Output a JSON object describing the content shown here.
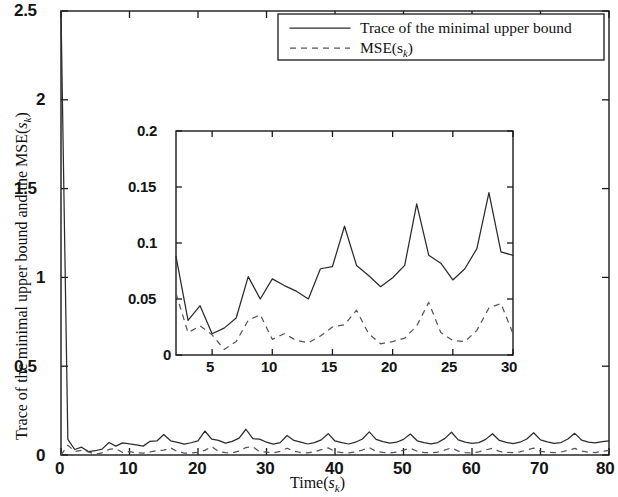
{
  "chart_data": {
    "type": "line",
    "title": "",
    "xlabel": "Time(s_k)",
    "xlabel_main": "Time",
    "xlabel_sub": "k",
    "ylabel": "Trace of the minimal upper bound and the MSE(s_k)",
    "ylabel_main": "Trace of the minimal upper bound and the MSE(",
    "ylabel_sub": "k",
    "ylabel_tail": ")",
    "xlim": [
      0,
      80
    ],
    "ylim": [
      0,
      2.5
    ],
    "grid": false,
    "legend_position": "top-right",
    "xticks": [
      0,
      10,
      20,
      30,
      40,
      50,
      60,
      70,
      80
    ],
    "xtick_labels": [
      "0",
      "10",
      "20",
      "30",
      "40",
      "50",
      "60",
      "70",
      "80"
    ],
    "yticks": [
      0,
      0.5,
      1,
      1.5,
      2,
      2.5
    ],
    "ytick_labels": [
      "0",
      "0.5",
      "1",
      "1.5",
      "2",
      "2.5"
    ],
    "series": [
      {
        "name": "Trace of the minimal upper bound",
        "style": "solid",
        "color": "#2b2b2b",
        "x": [
          0,
          1,
          2,
          3,
          4,
          5,
          6,
          7,
          8,
          9,
          10,
          11,
          12,
          13,
          14,
          15,
          16,
          17,
          18,
          19,
          20,
          21,
          22,
          23,
          24,
          25,
          26,
          27,
          28,
          29,
          30,
          31,
          32,
          33,
          34,
          35,
          36,
          37,
          38,
          39,
          40,
          41,
          42,
          43,
          44,
          45,
          46,
          47,
          48,
          49,
          50,
          51,
          52,
          53,
          54,
          55,
          56,
          57,
          58,
          59,
          60,
          61,
          62,
          63,
          64,
          65,
          66,
          67,
          68,
          69,
          70,
          71,
          72,
          73,
          74,
          75,
          76,
          77,
          78,
          79,
          80
        ],
        "values": [
          2.5,
          0.088,
          0.031,
          0.044,
          0.019,
          0.024,
          0.033,
          0.07,
          0.05,
          0.068,
          0.062,
          0.057,
          0.05,
          0.077,
          0.079,
          0.115,
          0.08,
          0.071,
          0.061,
          0.069,
          0.08,
          0.135,
          0.089,
          0.082,
          0.067,
          0.077,
          0.095,
          0.145,
          0.092,
          0.089,
          0.072,
          0.061,
          0.07,
          0.11,
          0.082,
          0.072,
          0.062,
          0.07,
          0.085,
          0.12,
          0.079,
          0.07,
          0.062,
          0.072,
          0.09,
          0.13,
          0.088,
          0.075,
          0.067,
          0.072,
          0.088,
          0.118,
          0.08,
          0.07,
          0.063,
          0.07,
          0.092,
          0.128,
          0.085,
          0.072,
          0.065,
          0.07,
          0.088,
          0.12,
          0.082,
          0.071,
          0.064,
          0.072,
          0.09,
          0.125,
          0.085,
          0.074,
          0.066,
          0.07,
          0.09,
          0.122,
          0.084,
          0.072,
          0.068,
          0.075,
          0.08
        ]
      },
      {
        "name": "MSE(s_k)",
        "style": "dashed",
        "color": "#555555",
        "x": [
          0,
          1,
          2,
          3,
          4,
          5,
          6,
          7,
          8,
          9,
          10,
          11,
          12,
          13,
          14,
          15,
          16,
          17,
          18,
          19,
          20,
          21,
          22,
          23,
          24,
          25,
          26,
          27,
          28,
          29,
          30,
          31,
          32,
          33,
          34,
          35,
          36,
          37,
          38,
          39,
          40,
          41,
          42,
          43,
          44,
          45,
          46,
          47,
          48,
          49,
          50,
          51,
          52,
          53,
          54,
          55,
          56,
          57,
          58,
          59,
          60,
          61,
          62,
          63,
          64,
          65,
          66,
          67,
          68,
          69,
          70,
          71,
          72,
          73,
          74,
          75,
          76,
          77,
          78,
          79,
          80
        ],
        "values": [
          0.0,
          0.055,
          0.02,
          0.026,
          0.018,
          0.005,
          0.012,
          0.031,
          0.036,
          0.014,
          0.019,
          0.013,
          0.011,
          0.017,
          0.025,
          0.027,
          0.04,
          0.019,
          0.01,
          0.012,
          0.015,
          0.026,
          0.047,
          0.02,
          0.013,
          0.012,
          0.022,
          0.042,
          0.046,
          0.019,
          0.016,
          0.012,
          0.02,
          0.038,
          0.022,
          0.014,
          0.012,
          0.018,
          0.03,
          0.04,
          0.02,
          0.014,
          0.012,
          0.018,
          0.028,
          0.042,
          0.02,
          0.015,
          0.012,
          0.017,
          0.027,
          0.038,
          0.021,
          0.014,
          0.012,
          0.016,
          0.028,
          0.04,
          0.022,
          0.014,
          0.012,
          0.018,
          0.029,
          0.038,
          0.02,
          0.015,
          0.013,
          0.018,
          0.028,
          0.039,
          0.021,
          0.015,
          0.013,
          0.017,
          0.027,
          0.037,
          0.022,
          0.016,
          0.014,
          0.02,
          0.026
        ]
      }
    ],
    "inset": {
      "xlim": [
        2,
        30
      ],
      "ylim": [
        0,
        0.2
      ],
      "xticks": [
        5,
        10,
        15,
        20,
        25,
        30
      ],
      "xtick_labels": [
        "5",
        "10",
        "15",
        "20",
        "25",
        "30"
      ],
      "yticks": [
        0,
        0.05,
        0.1,
        0.15,
        0.2
      ],
      "ytick_labels": [
        "0",
        "0.05",
        "0.1",
        "0.15",
        "0.2"
      ],
      "grid": false,
      "series": [
        {
          "name": "Trace of the minimal upper bound",
          "style": "solid",
          "color": "#2b2b2b",
          "x": [
            2,
            3,
            4,
            5,
            6,
            7,
            8,
            9,
            10,
            11,
            12,
            13,
            14,
            15,
            16,
            17,
            18,
            19,
            20,
            21,
            22,
            23,
            24,
            25,
            26,
            27,
            28,
            29,
            30
          ],
          "values": [
            0.088,
            0.031,
            0.044,
            0.019,
            0.024,
            0.033,
            0.07,
            0.05,
            0.068,
            0.062,
            0.057,
            0.05,
            0.077,
            0.079,
            0.115,
            0.08,
            0.071,
            0.061,
            0.069,
            0.08,
            0.135,
            0.089,
            0.082,
            0.067,
            0.077,
            0.095,
            0.145,
            0.092,
            0.089
          ]
        },
        {
          "name": "MSE(s_k)",
          "style": "dashed",
          "color": "#555555",
          "x": [
            2,
            3,
            4,
            5,
            6,
            7,
            8,
            9,
            10,
            11,
            12,
            13,
            14,
            15,
            16,
            17,
            18,
            19,
            20,
            21,
            22,
            23,
            24,
            25,
            26,
            27,
            28,
            29,
            30
          ],
          "values": [
            0.055,
            0.02,
            0.026,
            0.018,
            0.005,
            0.012,
            0.031,
            0.036,
            0.014,
            0.019,
            0.013,
            0.011,
            0.017,
            0.025,
            0.027,
            0.04,
            0.019,
            0.01,
            0.012,
            0.015,
            0.026,
            0.047,
            0.02,
            0.013,
            0.012,
            0.022,
            0.042,
            0.046,
            0.019
          ]
        }
      ]
    },
    "legend": [
      {
        "label": "Trace of the minimal upper bound",
        "style": "solid"
      },
      {
        "label": "MSE(s_k)",
        "label_main": "MSE(",
        "label_sub": "k",
        "label_tail": ")",
        "style": "dashed"
      }
    ]
  },
  "colors": {
    "axis": "#1a1a1a",
    "solid_series": "#2b2b2b",
    "dashed_series": "#555555",
    "background": "#ffffff"
  }
}
